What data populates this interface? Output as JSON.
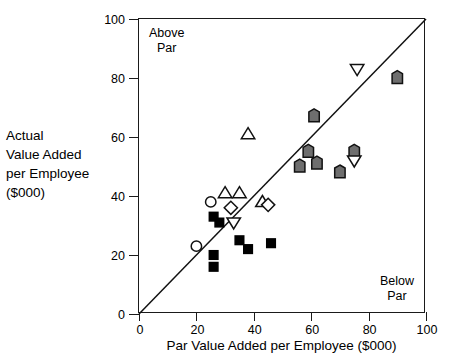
{
  "chart_data": {
    "type": "scatter",
    "title": "",
    "xlabel": "Par Value Added per Employee ($000)",
    "ylabel_lines": [
      "Actual",
      "Value Added",
      "per Employee",
      "($000)"
    ],
    "ylabel": "Actual Value Added per Employee ($000)",
    "xlim": [
      0,
      100
    ],
    "ylim": [
      0,
      100
    ],
    "xticks": [
      0,
      20,
      40,
      60,
      80,
      100
    ],
    "yticks": [
      0,
      20,
      40,
      60,
      80,
      100
    ],
    "grid": false,
    "legend_position": "none",
    "annotations": [
      {
        "text_lines": [
          "Above",
          "Par"
        ],
        "text": "Above Par",
        "position": "top-left"
      },
      {
        "text_lines": [
          "Below",
          "Par"
        ],
        "text": "Below Par",
        "position": "bottom-right"
      }
    ],
    "reference_line": {
      "name": "parity-line",
      "description": "45 degree line y = x",
      "from": [
        0,
        0
      ],
      "to": [
        100,
        100
      ]
    },
    "series": [
      {
        "name": "Gray pentagon group",
        "marker": "pentagon",
        "fill": "#6e6e6e",
        "edge": "#111111",
        "points": [
          [
            56,
            50
          ],
          [
            59,
            55
          ],
          [
            61,
            67
          ],
          [
            62,
            51
          ],
          [
            70,
            48
          ],
          [
            75,
            55
          ],
          [
            90,
            80
          ]
        ]
      },
      {
        "name": "Open down-triangle group",
        "marker": "triangle-down",
        "fill": "#ffffff",
        "edge": "#111111",
        "points": [
          [
            33,
            31
          ],
          [
            75,
            52
          ],
          [
            76,
            83
          ]
        ]
      },
      {
        "name": "Open up-triangle group",
        "marker": "triangle-up",
        "fill": "#ffffff",
        "edge": "#111111",
        "points": [
          [
            30,
            41
          ],
          [
            35,
            41
          ],
          [
            38,
            61
          ],
          [
            43,
            38
          ]
        ]
      },
      {
        "name": "Open diamond group",
        "marker": "diamond",
        "fill": "#ffffff",
        "edge": "#111111",
        "points": [
          [
            32,
            36
          ],
          [
            45,
            37
          ]
        ]
      },
      {
        "name": "Open circle group",
        "marker": "circle",
        "fill": "#ffffff",
        "edge": "#111111",
        "points": [
          [
            20,
            23
          ],
          [
            25,
            38
          ]
        ]
      },
      {
        "name": "Filled square group",
        "marker": "square",
        "fill": "#000000",
        "edge": "#000000",
        "points": [
          [
            26,
            16
          ],
          [
            26,
            20
          ],
          [
            26,
            33
          ],
          [
            28,
            31
          ],
          [
            35,
            25
          ],
          [
            38,
            22
          ],
          [
            46,
            24
          ]
        ]
      }
    ]
  }
}
